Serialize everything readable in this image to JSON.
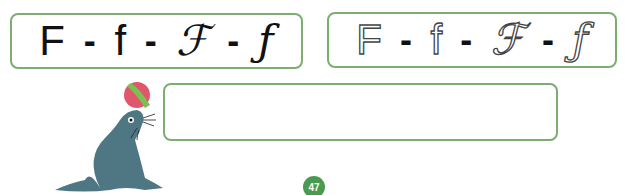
{
  "model_row": {
    "items": [
      "F",
      "-",
      "f",
      "-",
      "ℱ",
      "-",
      "ƒ"
    ],
    "labels": {
      "upper_print": "F",
      "lower_print": "f",
      "upper_cursive": "ℱ",
      "lower_cursive": "ƒ",
      "separator": "-"
    }
  },
  "trace_row": {
    "upper_print": "F",
    "lower_print": "f",
    "upper_cursive": "ℱ",
    "lower_cursive": "ƒ",
    "separator": "-"
  },
  "answer_box": {
    "value": ""
  },
  "illustration": {
    "subject": "seal-balancing-ball-icon"
  },
  "page": {
    "number": "47"
  },
  "colors": {
    "border": "#7cae72",
    "badge": "#4a9a50",
    "seal": "#4f7683",
    "ball_red": "#e0566b",
    "ball_green": "#7cbf52"
  }
}
